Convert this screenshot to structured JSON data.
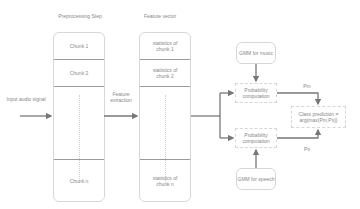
{
  "headers": {
    "preprocessing": "Preprocessing Step",
    "feature_vector": "Feature vector"
  },
  "input": {
    "label": "Input audio signal"
  },
  "feature_extraction": {
    "label": "Feature extraction"
  },
  "chunks": {
    "c1": "Chunk 1",
    "c2": "Chunk 2",
    "dots": ":",
    "cn": "Chunk n"
  },
  "stats": {
    "s1": "statistics of chunk 1",
    "s2": "statistics of chunk 2",
    "dots": ":",
    "sn": "statistics of chunk n"
  },
  "gmm": {
    "music": "GMM for music",
    "speech": "GMM for speech"
  },
  "probability": {
    "top": "Probability computation",
    "bottom": "Probability computation"
  },
  "class_prediction": {
    "label": "Class prediction = arg{max(Pm,Ps)}"
  },
  "edge_labels": {
    "pm": "Pm",
    "ps": "Ps"
  },
  "colors": {
    "arrow": "#777777",
    "divider": "#9a9a9a",
    "border": "#d8d8d8"
  }
}
